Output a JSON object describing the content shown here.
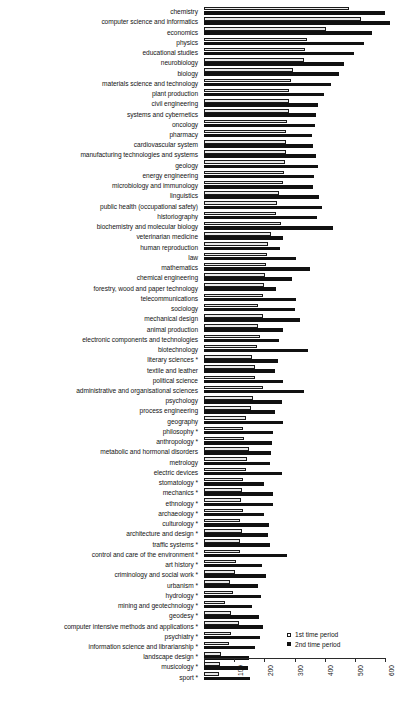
{
  "chart_data": {
    "type": "bar",
    "orientation": "horizontal",
    "title": "",
    "xlabel": "",
    "ylabel": "",
    "xlim": [
      0,
      600
    ],
    "xticks": [
      0,
      100,
      200,
      300,
      400,
      500,
      600
    ],
    "grid": false,
    "legend_position": "bottom-right",
    "footnote_marker": "*",
    "categories": [
      "chemistry",
      "computer science and informatics",
      "economics",
      "physics",
      "educational studies",
      "neurobiology",
      "biology",
      "materials science and technology",
      "plant production",
      "civil engineering",
      "systems and cybernetics",
      "oncology",
      "pharmacy",
      "cardiovascular system",
      "manufacturing technologies and systems",
      "geology",
      "energy engineering",
      "microbiology and immunology",
      "linguistics",
      "public health (occupational safety)",
      "historiography",
      "biochemistry and molecular biology",
      "veterinarian medicine",
      "human reproduction",
      "law",
      "mathematics",
      "chemical engineering",
      "forestry, wood and paper technology",
      "telecommunications",
      "sociology",
      "mechanical design",
      "animal production",
      "electronic components and technologies",
      "biotechnology",
      "literary sciences *",
      "textile and leather",
      "political science",
      "administrative and organisational sciences",
      "psychology",
      "process engineering",
      "geography",
      "philosophy *",
      "anthropology *",
      "metabolic and hormonal disorders",
      "metrology",
      "electric devices",
      "stomatology *",
      "mechanics *",
      "ethnology *",
      "archaeology *",
      "culturology *",
      "architecture and design *",
      "traffic systems *",
      "control and care of the environment *",
      "art history *",
      "criminology and social work *",
      "urbanism *",
      "hydrology *",
      "mining and geotechnology *",
      "geodesy *",
      "computer intensive methods and applications *",
      "psychiatry *",
      "information science and librarianship *",
      "landscape design *",
      "musicology *",
      "sport *"
    ],
    "series": [
      {
        "name": "1st time period",
        "style": "open",
        "values": [
          480,
          520,
          405,
          340,
          335,
          332,
          295,
          287,
          283,
          282,
          280,
          276,
          273,
          272,
          270,
          268,
          265,
          263,
          247,
          243,
          240,
          255,
          222,
          212,
          208,
          205,
          202,
          198,
          195,
          178,
          194,
          180,
          185,
          175,
          160,
          170,
          168,
          195,
          162,
          155,
          140,
          128,
          132,
          150,
          143,
          140,
          130,
          127,
          122,
          128,
          120,
          125,
          118,
          120,
          105,
          102,
          85,
          95,
          70,
          88,
          115,
          90,
          82,
          55,
          52,
          50
        ]
      },
      {
        "name": "2nd time period",
        "style": "filled",
        "values": [
          600,
          615,
          557,
          530,
          498,
          462,
          448,
          420,
          398,
          378,
          372,
          368,
          358,
          362,
          370,
          378,
          365,
          360,
          382,
          390,
          375,
          428,
          262,
          250,
          305,
          350,
          292,
          240,
          305,
          300,
          318,
          262,
          248,
          345,
          245,
          235,
          262,
          330,
          258,
          235,
          262,
          228,
          225,
          222,
          218,
          258,
          198,
          228,
          230,
          200,
          215,
          212,
          218,
          275,
          192,
          205,
          178,
          188,
          158,
          182,
          195,
          185,
          168,
          148,
          145,
          152
        ]
      }
    ]
  },
  "legend": {
    "items": [
      {
        "label": "1st time period",
        "style": "open"
      },
      {
        "label": "2nd time period",
        "style": "filled"
      }
    ]
  },
  "axis": {
    "tick_labels": [
      "0",
      "100",
      "200",
      "300",
      "400",
      "500",
      "600"
    ]
  }
}
